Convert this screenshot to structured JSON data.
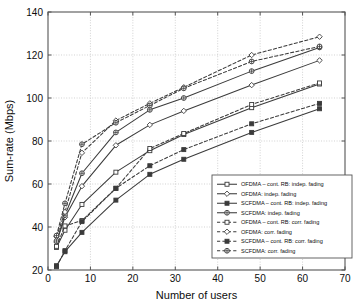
{
  "chart_data": {
    "type": "line",
    "title": "",
    "xlabel": "Number of users",
    "ylabel": "Sum-rate (Mbps)",
    "xlim": [
      0,
      70
    ],
    "ylim": [
      20,
      140
    ],
    "xticks": [
      0,
      10,
      20,
      30,
      40,
      50,
      60,
      70
    ],
    "yticks": [
      20,
      40,
      60,
      80,
      100,
      120,
      140
    ],
    "xtick_labels": [
      "0",
      "10",
      "20",
      "30",
      "40",
      "50",
      "60",
      "70"
    ],
    "ytick_labels": [
      "20",
      "40",
      "60",
      "80",
      "100",
      "120",
      "140"
    ],
    "grid": true,
    "legend_position": "lower right",
    "x": [
      2,
      4,
      8,
      16,
      24,
      32,
      48,
      64
    ],
    "series": [
      {
        "name": "OFDMA – cont. RB: indep. fading",
        "style": "solid",
        "marker": "square-open",
        "values": [
          30.5,
          38.5,
          50.5,
          65.5,
          75.5,
          83.0,
          95.5,
          106.5
        ]
      },
      {
        "name": "OFDMA: indep. fading",
        "style": "solid",
        "marker": "diamond-open",
        "values": [
          33.0,
          44.5,
          59.0,
          78.0,
          87.5,
          94.0,
          106.0,
          117.5
        ]
      },
      {
        "name": "SCFDMA – cont. RB: indep. fading",
        "style": "solid",
        "marker": "square-filled",
        "values": [
          22.0,
          28.5,
          37.5,
          52.5,
          64.5,
          71.5,
          84.0,
          95.0
        ]
      },
      {
        "name": "SCFDMA: indep. fading",
        "style": "solid",
        "marker": "circle-cross",
        "values": [
          33.5,
          45.5,
          65.0,
          84.0,
          94.5,
          100.0,
          112.5,
          123.5
        ]
      },
      {
        "name": "OFDMA – cont. RB: corr. fading",
        "style": "dashed",
        "marker": "square-open",
        "values": [
          31.0,
          40.5,
          43.0,
          58.0,
          76.5,
          83.5,
          97.0,
          107.0
        ]
      },
      {
        "name": "OFDMA: corr. fading",
        "style": "dashed",
        "marker": "diamond-open",
        "values": [
          35.5,
          47.0,
          74.5,
          89.5,
          97.5,
          105.0,
          120.0,
          128.5
        ]
      },
      {
        "name": "SCFDMA – cont. RB: corr. fading",
        "style": "dashed",
        "marker": "square-filled",
        "values": [
          21.5,
          29.0,
          42.5,
          58.0,
          68.5,
          76.0,
          88.0,
          97.5
        ]
      },
      {
        "name": "SCFDMA: corr. fading",
        "style": "dashed",
        "marker": "circle-cross",
        "values": [
          36.0,
          51.0,
          78.5,
          88.5,
          96.5,
          104.5,
          117.0,
          124.0
        ]
      }
    ],
    "colors": {
      "line": "#3b3b3b",
      "grid": "#bfbfbf",
      "axis": "#555555",
      "text": "#0d0d0d",
      "background": "#ffffff"
    }
  }
}
